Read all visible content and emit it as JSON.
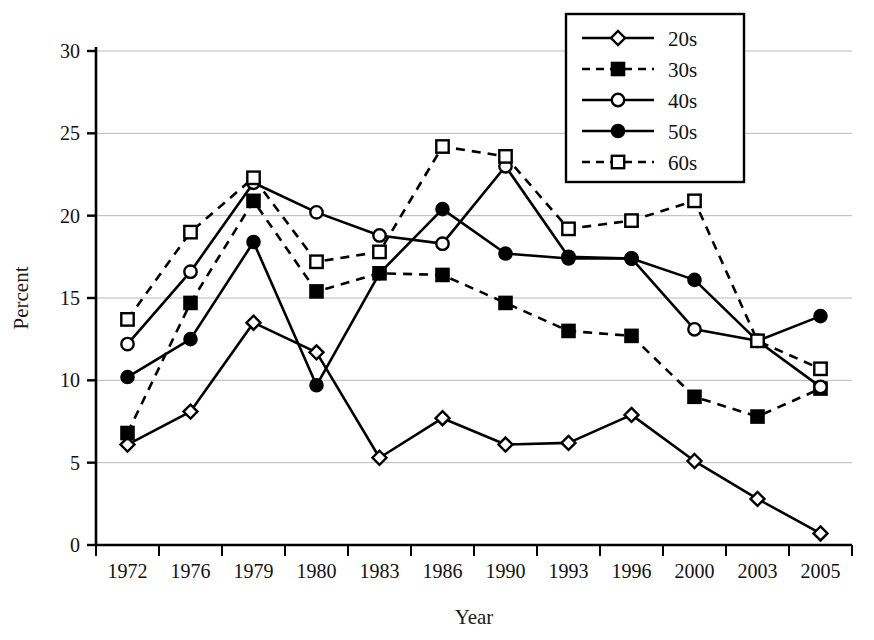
{
  "chart_data": {
    "type": "line",
    "title": "",
    "xlabel": "Year",
    "ylabel": "Percent",
    "categories": [
      "1972",
      "1976",
      "1979",
      "1980",
      "1983",
      "1986",
      "1990",
      "1993",
      "1996",
      "2000",
      "2003",
      "2005"
    ],
    "ylim": [
      0,
      30
    ],
    "yticks": [
      0,
      5,
      10,
      15,
      20,
      25,
      30
    ],
    "grid": "horizontal",
    "legend_position": "top-right",
    "series": [
      {
        "name": "20s",
        "marker": "open-diamond",
        "line": "solid",
        "color": "#000000",
        "values": [
          6.1,
          8.1,
          13.5,
          11.7,
          5.3,
          7.7,
          6.1,
          6.2,
          7.9,
          5.1,
          2.8,
          0.7
        ]
      },
      {
        "name": "30s",
        "marker": "filled-square",
        "line": "dashed",
        "color": "#000000",
        "values": [
          6.8,
          14.7,
          20.9,
          15.4,
          16.5,
          16.4,
          14.7,
          13.0,
          12.7,
          9.0,
          7.8,
          9.5
        ]
      },
      {
        "name": "40s",
        "marker": "open-circle",
        "line": "solid",
        "color": "#000000",
        "values": [
          12.2,
          16.6,
          22.0,
          20.2,
          18.8,
          18.3,
          23.0,
          17.5,
          17.4,
          13.1,
          12.4,
          9.6
        ]
      },
      {
        "name": "50s",
        "marker": "filled-circle",
        "line": "solid",
        "color": "#000000",
        "values": [
          10.2,
          12.5,
          18.4,
          9.7,
          16.5,
          20.4,
          17.7,
          17.4,
          17.4,
          16.1,
          12.4,
          13.9
        ]
      },
      {
        "name": "60s",
        "marker": "open-square",
        "line": "dashed",
        "color": "#000000",
        "values": [
          13.7,
          19.0,
          22.3,
          17.2,
          17.8,
          24.2,
          23.6,
          19.2,
          19.7,
          20.9,
          12.4,
          10.7
        ]
      }
    ]
  },
  "legend": {
    "items": [
      {
        "label": "20s"
      },
      {
        "label": "30s"
      },
      {
        "label": "40s"
      },
      {
        "label": "50s"
      },
      {
        "label": "60s"
      }
    ]
  },
  "axes": {
    "y_title": "Percent",
    "x_title": "Year",
    "y_tick_labels": [
      "0",
      "5",
      "10",
      "15",
      "20",
      "25",
      "30"
    ],
    "x_tick_labels": [
      "1972",
      "1976",
      "1979",
      "1980",
      "1983",
      "1986",
      "1990",
      "1993",
      "1996",
      "2000",
      "2003",
      "2005"
    ]
  }
}
